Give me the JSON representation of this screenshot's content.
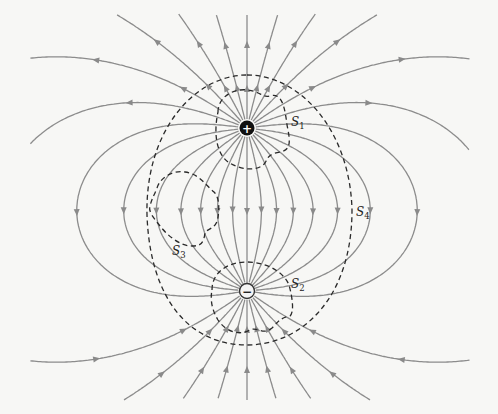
{
  "diagram": {
    "colors": {
      "background": "#f7f7f5",
      "field_line": "#8c8c8c",
      "surface": "#2a2a2a",
      "positive_fill": "#111111",
      "negative_fill": "#f4f4f4"
    },
    "charges": [
      {
        "id": "positive",
        "sign": "+",
        "x": 247,
        "y": 128
      },
      {
        "id": "negative",
        "sign": "−",
        "x": 247,
        "y": 291
      }
    ],
    "field_lines_per_charge": 26,
    "surfaces": [
      {
        "id": "S1",
        "label": "S",
        "sub": "1",
        "label_x": 291,
        "label_y": 126
      },
      {
        "id": "S2",
        "label": "S",
        "sub": "2",
        "label_x": 291,
        "label_y": 288
      },
      {
        "id": "S3",
        "label": "S",
        "sub": "3",
        "label_x": 172,
        "label_y": 255
      },
      {
        "id": "S4",
        "label": "S",
        "sub": "4",
        "label_x": 356,
        "label_y": 216
      }
    ]
  }
}
